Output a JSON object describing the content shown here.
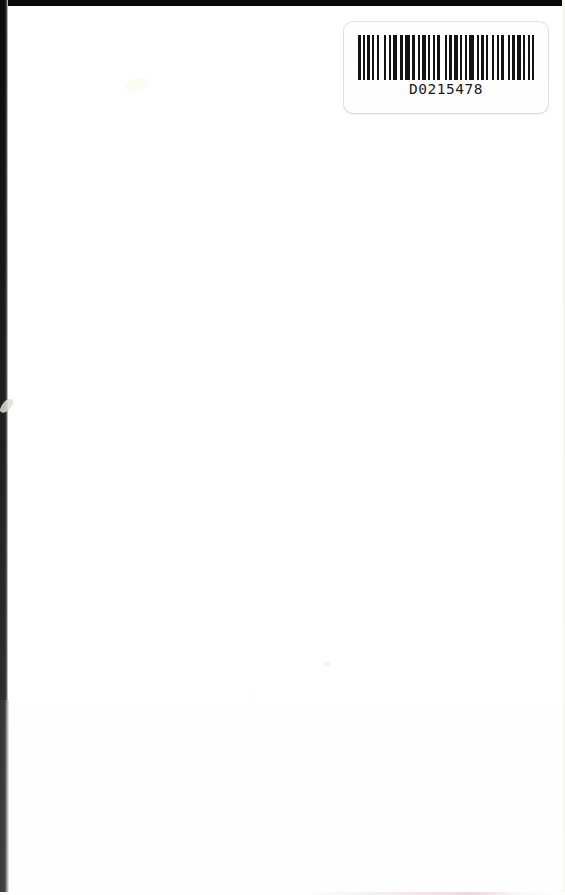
{
  "page": {
    "kind": "scanned-document-page",
    "width": 565,
    "height": 895,
    "background_color": "#ffffff",
    "body_text": ""
  },
  "scan_frame": {
    "top_band_color": "#080808",
    "left_band_color": "#0a0a0a",
    "right_band_color": "#f2f2f0",
    "bottom_tint_color": "#e9cfe0"
  },
  "barcode_label": {
    "value": "D0215478",
    "background_color": "#fefefe",
    "bar_color": "#101010",
    "text_color": "#161616",
    "symbology_hint": "linear-barcode",
    "bar_pattern": [
      3,
      2,
      2,
      2,
      3,
      2,
      2,
      3,
      2,
      5,
      2,
      3,
      2,
      2,
      4,
      3,
      3,
      2,
      5,
      2,
      3,
      3,
      2,
      2,
      4,
      2,
      2,
      3,
      2,
      2,
      3,
      5,
      2,
      2,
      3,
      2,
      4,
      2,
      2,
      3,
      2,
      2,
      5,
      3,
      2,
      2,
      3,
      2,
      2,
      4,
      2,
      3,
      2,
      2,
      3,
      4,
      2,
      2,
      3,
      2,
      4,
      2,
      2,
      3,
      2,
      2,
      3,
      2,
      5,
      2,
      2,
      3,
      3,
      2,
      2,
      4,
      2,
      2,
      3,
      3
    ]
  },
  "artifacts": {
    "edge_nick_label": "scanner-edge-nick",
    "smudge_topleft_label": "paper-smudge",
    "smudge_center_label": "paper-speck"
  }
}
